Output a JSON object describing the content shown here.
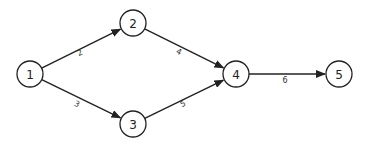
{
  "diagram": {
    "type": "directed-network",
    "nodes": [
      {
        "id": "1",
        "label": "1",
        "x": 30,
        "y": 74
      },
      {
        "id": "2",
        "label": "2",
        "x": 133,
        "y": 23
      },
      {
        "id": "3",
        "label": "3",
        "x": 133,
        "y": 124
      },
      {
        "id": "4",
        "label": "4",
        "x": 236,
        "y": 74
      },
      {
        "id": "5",
        "label": "5",
        "x": 339,
        "y": 74
      }
    ],
    "edges": [
      {
        "from": "1",
        "to": "2",
        "label": "2",
        "lx": 80,
        "ly": 53
      },
      {
        "from": "1",
        "to": "3",
        "label": "3",
        "lx": 77,
        "ly": 104
      },
      {
        "from": "2",
        "to": "4",
        "label": "4",
        "lx": 179,
        "ly": 52
      },
      {
        "from": "3",
        "to": "4",
        "label": "5",
        "lx": 183,
        "ly": 104
      },
      {
        "from": "4",
        "to": "5",
        "label": "6",
        "lx": 285,
        "ly": 80
      }
    ],
    "node_radius": 13,
    "stroke_color": "#222222",
    "background_color": "#ffffff"
  }
}
